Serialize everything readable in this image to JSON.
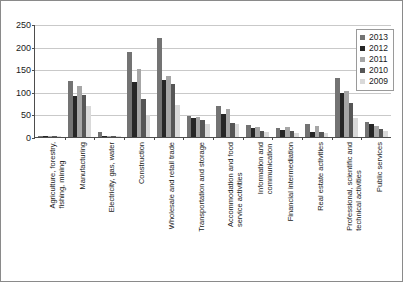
{
  "chart_data": {
    "type": "bar",
    "title": "",
    "xlabel": "",
    "ylabel": "",
    "ylim": [
      0,
      250
    ],
    "yticks": [
      0,
      50,
      100,
      150,
      200,
      250
    ],
    "grid": true,
    "legend_position": "top-right",
    "categories": [
      "Agriculture, forestry, fishing, mining",
      "Manufacturing",
      "Electricity, gas, water",
      "Construction",
      "Wholesale and retail trade",
      "Transportation and storage",
      "Accommodation and food service activities",
      "Information and communication",
      "Financial intermediation",
      "Real estate activities",
      "Professional, scientific and technical activities",
      "Public services"
    ],
    "series": [
      {
        "name": "2013",
        "color": "#737373",
        "values": [
          2,
          124,
          11,
          189,
          220,
          46,
          68,
          26,
          21,
          29,
          131,
          34
        ]
      },
      {
        "name": "2012",
        "color": "#262626",
        "values": [
          2,
          91,
          3,
          122,
          127,
          42,
          50,
          19,
          16,
          11,
          98,
          29
        ]
      },
      {
        "name": "2011",
        "color": "#a6a6a6",
        "values": [
          2,
          113,
          2,
          150,
          136,
          44,
          62,
          23,
          22,
          24,
          102,
          24
        ]
      },
      {
        "name": "2010",
        "color": "#565656",
        "values": [
          1,
          93,
          2,
          85,
          117,
          38,
          31,
          13,
          13,
          10,
          75,
          17
        ]
      },
      {
        "name": "2009",
        "color": "#d9d9d9",
        "values": [
          1,
          68,
          1,
          49,
          70,
          28,
          29,
          11,
          9,
          8,
          43,
          14
        ]
      }
    ]
  },
  "legend": {
    "items": [
      {
        "label": "2013"
      },
      {
        "label": "2012"
      },
      {
        "label": "2011"
      },
      {
        "label": "2010"
      },
      {
        "label": "2009"
      }
    ]
  },
  "category_label_lines": [
    [
      "Agriculture, forestry,",
      "fishing, mining"
    ],
    [
      "Manufacturing"
    ],
    [
      "Electricity, gas, water"
    ],
    [
      "Construction"
    ],
    [
      "Wholesale and retail trade"
    ],
    [
      "Transportation and storage"
    ],
    [
      "Accommodation and food",
      "service activities"
    ],
    [
      "Information and",
      "communication"
    ],
    [
      "Financial intermediation"
    ],
    [
      "Real estate activities"
    ],
    [
      "Professional, scientific and",
      "technical activities"
    ],
    [
      "Public services"
    ]
  ]
}
